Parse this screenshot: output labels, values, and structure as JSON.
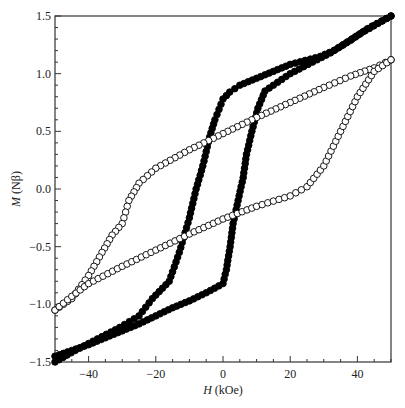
{
  "chart_data": {
    "type": "scatter",
    "title": "",
    "xlabel": "H (kOe)",
    "ylabel": "M (Nβ)",
    "xlabel_italic": "H",
    "xlabel_unit": " (kOe)",
    "ylabel_italic": "M",
    "ylabel_unit": " (Nβ)",
    "xlim": [
      -50,
      50
    ],
    "ylim": [
      -1.5,
      1.5
    ],
    "xticks": [
      -40,
      -20,
      0,
      20,
      40
    ],
    "xtick_labels": [
      "−40",
      "−20",
      "0",
      "20",
      "40"
    ],
    "yticks": [
      -1.5,
      -1.0,
      -0.5,
      0.0,
      0.5,
      1.0,
      1.5
    ],
    "ytick_labels": [
      "−1.5",
      "−1.0",
      "−0.5",
      "0.0",
      "0.5",
      "1.0",
      "1.5"
    ],
    "grid": false,
    "legend": null,
    "series": [
      {
        "name": "filled circles",
        "marker": "filled",
        "color": "#000000",
        "branch_descending": {
          "x": [
            50,
            43,
            38,
            33,
            29,
            20,
            15,
            10,
            5,
            2,
            0,
            -2.4,
            -4,
            -6,
            -8,
            -10,
            -13,
            -16,
            -21,
            -25,
            -30.7,
            -44,
            -50
          ],
          "y": [
            1.5,
            1.39,
            1.29,
            1.2,
            1.15,
            1.08,
            1.02,
            0.96,
            0.9,
            0.84,
            0.78,
            0.6,
            0.45,
            0.2,
            0.0,
            -0.25,
            -0.55,
            -0.8,
            -0.95,
            -1.1,
            -1.2,
            -1.4,
            -1.5
          ]
        },
        "branch_ascending": {
          "x": [
            -50,
            -45,
            -40,
            -35,
            -30,
            -25,
            -20,
            -15,
            -10,
            -5,
            0,
            1,
            2.1,
            3,
            4.5,
            6,
            7,
            8.6,
            10.4,
            12.5,
            20,
            32,
            41,
            50
          ],
          "y": [
            -1.45,
            -1.4,
            -1.35,
            -1.29,
            -1.23,
            -1.17,
            -1.1,
            -1.03,
            -0.97,
            -0.9,
            -0.82,
            -0.7,
            -0.5,
            -0.3,
            -0.1,
            0.1,
            0.3,
            0.5,
            0.7,
            0.85,
            1.0,
            1.18,
            1.35,
            1.5
          ]
        }
      },
      {
        "name": "open circles",
        "marker": "open",
        "color": "#000000",
        "branch_descending": {
          "x": [
            50,
            45,
            38,
            30,
            20,
            10,
            0,
            -10,
            -20,
            -25,
            -28,
            -30,
            -33,
            -36,
            -40,
            -45,
            -50
          ],
          "y": [
            1.12,
            1.05,
            0.98,
            0.88,
            0.75,
            0.62,
            0.48,
            0.34,
            0.18,
            0.05,
            -0.1,
            -0.3,
            -0.4,
            -0.55,
            -0.75,
            -0.95,
            -1.05
          ]
        },
        "branch_ascending": {
          "x": [
            -50,
            -45,
            -40,
            -30,
            -20,
            -10,
            0,
            10,
            20,
            25,
            30,
            35,
            40,
            45,
            50
          ],
          "y": [
            -1.05,
            -0.93,
            -0.82,
            -0.67,
            -0.53,
            -0.39,
            -0.26,
            -0.15,
            -0.06,
            0.02,
            0.2,
            0.5,
            0.8,
            1.02,
            1.12
          ]
        }
      }
    ]
  }
}
